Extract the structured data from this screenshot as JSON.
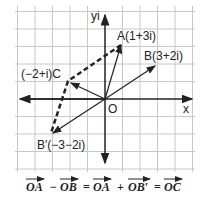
{
  "diagram": {
    "axes": {
      "x_label": "x",
      "y_label": "yi",
      "origin_label": "O"
    },
    "points": [
      {
        "id": "A",
        "label": "A(1+3i)",
        "re": 1,
        "im": 3
      },
      {
        "id": "B",
        "label": "B(3+2i)",
        "re": 3,
        "im": 2
      },
      {
        "id": "C",
        "label": "(−2+i)C",
        "re": -2,
        "im": 1
      },
      {
        "id": "B_prime",
        "label": "B′(−3−2i)",
        "re": -3,
        "im": -2
      }
    ],
    "equation": {
      "t1": "OA",
      "op1": "−",
      "t2": "OB",
      "eq1": "=",
      "t3": "OA",
      "op2": "+",
      "t4": "OB′",
      "eq2": "=",
      "t5": "OC"
    },
    "colors": {
      "grid": "#c8c8c8",
      "ink": "#222222"
    }
  }
}
